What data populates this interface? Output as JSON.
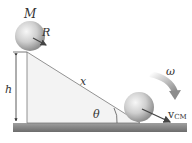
{
  "diagram": {
    "labels": {
      "mass": "M",
      "radius": "R",
      "height": "h",
      "incline_length": "x",
      "angle": "θ",
      "angular_velocity": "ω",
      "velocity_main": "v",
      "velocity_sub": "CM"
    },
    "colors": {
      "ground": "#8a8a8a",
      "incline_fill": "#f3f3f3",
      "sphere_light": "#f2f2f2",
      "sphere_dark": "#9a9a9a",
      "arrow": "#555555",
      "omega_arrow": "#9a9a9a",
      "text": "#333333"
    }
  }
}
